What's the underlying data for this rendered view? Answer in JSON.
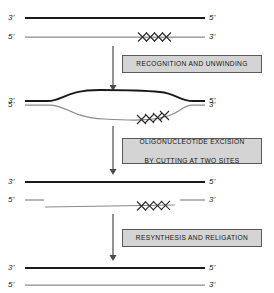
{
  "diagram": {
    "colors": {
      "template_strand": "#1a1a1a",
      "damaged_strand": "#8a8a8a",
      "box_fill": "#d4d4d4",
      "box_border": "#5a5a5a",
      "arrow": "#4a4a4a",
      "lesion": "#2b2b2b",
      "background": "#ffffff"
    },
    "stages": [
      {
        "id": "stage-1-intact-damaged-duplex",
        "labels": {
          "top_left": "3'",
          "top_right": "5'",
          "bottom_left": "5'",
          "bottom_right": "3'"
        },
        "lesion_marks": 4,
        "lesion_symbol": "XXXX"
      },
      {
        "id": "stage-2-unwound-bubble",
        "labels": {
          "top_left": "3'",
          "top_right": "5'",
          "bottom_left": "5'",
          "bottom_right": "3'"
        },
        "lesion_marks": 4,
        "lesion_symbol": "XXXX"
      },
      {
        "id": "stage-3-excised-oligonucleotide",
        "labels": {
          "top_left": "3'",
          "top_right": "5'",
          "bottom_left": "5'",
          "bottom_right": "3'"
        },
        "lesion_marks": 4,
        "lesion_symbol": "XXXX"
      },
      {
        "id": "stage-4-repaired-duplex",
        "labels": {
          "top_left": "3'",
          "top_right": "5'",
          "bottom_left": "5'",
          "bottom_right": "3'"
        },
        "lesion_marks": 0,
        "lesion_symbol": ""
      }
    ],
    "process_steps": [
      {
        "id": "step-recognition",
        "label": "RECOGNITION AND UNWINDING"
      },
      {
        "id": "step-excision",
        "label": "OLIGONUCLEOTIDE EXCISION\nBY CUTTING AT TWO SITES",
        "line1": "OLIGONUCLEOTIDE EXCISION",
        "line2": "BY CUTTING AT TWO SITES"
      },
      {
        "id": "step-resynthesis",
        "label": "RESYNTHESIS AND RELIGATION"
      }
    ]
  }
}
